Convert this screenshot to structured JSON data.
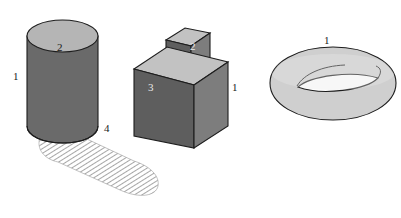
{
  "figure": {
    "background_color": "#ffffff",
    "width": 401,
    "height": 218
  },
  "palette": {
    "cylinder_body": "#6a6a6a",
    "cylinder_top": "#b5b5b5",
    "cube_front": "#5e5e5e",
    "cube_right": "#7d7d7d",
    "cube_top": "#c2c2c2",
    "small_cube_front": "#5e5e5e",
    "small_cube_right": "#7d7d7d",
    "small_cube_top": "#c2c2c2",
    "torus_fill": "#cfcfcf",
    "torus_inner": "#ffffff",
    "shadow_hatch": "#9a9a9a",
    "outline": "#1d1d1d",
    "letter_a": "#ffffff",
    "letter_b": "#141414"
  },
  "objects": {
    "cylinder": {
      "name": "cylinder",
      "side_label": "1",
      "top_label": "2",
      "shadow_label": "4"
    },
    "cube_stack": {
      "name": "cube-stack",
      "small_cube_label": "2",
      "big_cube_left_label": "3",
      "big_cube_right_label": "1",
      "front_letter": "A",
      "right_letter": "B"
    },
    "torus": {
      "name": "torus",
      "label": "1"
    }
  },
  "labels": [
    {
      "id": "cyl-side",
      "text": "1",
      "x": 13,
      "y": 71,
      "tone": "dark"
    },
    {
      "id": "cyl-top",
      "text": "2",
      "x": 57,
      "y": 42,
      "tone": "dark"
    },
    {
      "id": "cyl-shadow",
      "text": "4",
      "x": 104,
      "y": 123,
      "tone": "dark"
    },
    {
      "id": "small-cube",
      "text": "2",
      "x": 190,
      "y": 41,
      "tone": "light"
    },
    {
      "id": "cube-left",
      "text": "3",
      "x": 148,
      "y": 82,
      "tone": "light"
    },
    {
      "id": "cube-right",
      "text": "1",
      "x": 232,
      "y": 82,
      "tone": "dark"
    },
    {
      "id": "torus-top",
      "text": "1",
      "x": 324,
      "y": 35,
      "tone": "dark"
    }
  ]
}
